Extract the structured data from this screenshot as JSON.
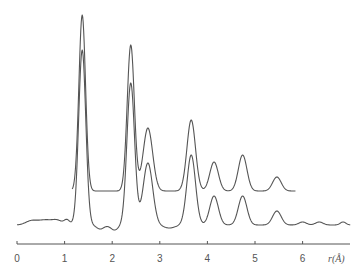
{
  "chart_data": {
    "type": "line",
    "title": "",
    "xlabel": "r(Å)",
    "ylabel": "",
    "xlim": [
      0,
      6.6
    ],
    "x_ticks": [
      0,
      1,
      2,
      3,
      4,
      5,
      6
    ],
    "x_tick_labels": [
      "0",
      "1",
      "2",
      "3",
      "4",
      "5",
      "6"
    ],
    "grid": false,
    "legend": null,
    "series": [
      {
        "name": "upper curve (model)",
        "x_range": [
          1.16,
          5.85
        ],
        "baseline_offset": 0,
        "peaks": [
          {
            "r": 1.37,
            "height": 176,
            "width": 0.07
          },
          {
            "r": 2.39,
            "height": 146,
            "width": 0.075
          },
          {
            "r": 2.75,
            "height": 63,
            "width": 0.1
          },
          {
            "r": 3.66,
            "height": 71,
            "width": 0.09
          },
          {
            "r": 4.14,
            "height": 29,
            "width": 0.09
          },
          {
            "r": 4.74,
            "height": 36,
            "width": 0.09
          },
          {
            "r": 5.46,
            "height": 14,
            "width": 0.09
          }
        ]
      },
      {
        "name": "lower curve (experimental)",
        "x_range": [
          0.0,
          7.0
        ],
        "baseline_offset": -34,
        "peaks": [
          {
            "r": 1.37,
            "height": 175,
            "width": 0.075
          },
          {
            "r": 2.39,
            "height": 142,
            "width": 0.08
          },
          {
            "r": 2.75,
            "height": 62,
            "width": 0.1
          },
          {
            "r": 3.66,
            "height": 70,
            "width": 0.09
          },
          {
            "r": 4.14,
            "height": 29,
            "width": 0.09
          },
          {
            "r": 4.74,
            "height": 29,
            "width": 0.09
          },
          {
            "r": 5.46,
            "height": 14,
            "width": 0.09
          }
        ],
        "ripples": [
          {
            "r": 0.3,
            "height": 4,
            "width": 0.12
          },
          {
            "r": 0.6,
            "height": 5,
            "width": 0.15
          },
          {
            "r": 0.85,
            "height": 4,
            "width": 0.1
          },
          {
            "r": 1.05,
            "height": 5,
            "width": 0.06
          },
          {
            "r": 1.75,
            "height": -4,
            "width": 0.08
          },
          {
            "r": 2.05,
            "height": -5,
            "width": 0.08
          },
          {
            "r": 3.2,
            "height": -3,
            "width": 0.12
          },
          {
            "r": 6.0,
            "height": 3,
            "width": 0.08
          },
          {
            "r": 6.35,
            "height": 3,
            "width": 0.08
          },
          {
            "r": 6.85,
            "height": 3,
            "width": 0.06
          }
        ]
      }
    ]
  },
  "axis": {
    "tick_labels": [
      "0",
      "1",
      "2",
      "3",
      "4",
      "5",
      "6"
    ],
    "label": "r(Å)"
  }
}
